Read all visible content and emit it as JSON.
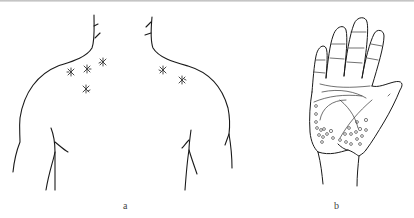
{
  "figure": {
    "panels": [
      {
        "label": "a",
        "subject": "upper back and shoulders",
        "markers": {
          "type": "asterisk-lesion",
          "count": 6
        }
      },
      {
        "label": "b",
        "subject": "palm of hand",
        "markers": {
          "type": "circular-papule",
          "count": 26
        }
      }
    ],
    "colors": {
      "line": "#1a1a1a",
      "marker": "#333333",
      "label": "#444444",
      "background": "#ffffff",
      "top_strip": "#c4c4c4"
    }
  }
}
